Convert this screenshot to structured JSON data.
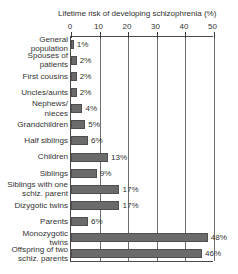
{
  "chart_data": {
    "type": "bar",
    "orientation": "horizontal",
    "title": "Lifetime risk of  developing schizophrenia (%)",
    "xlabel": "",
    "ylabel": "",
    "xlim": [
      0,
      50
    ],
    "xticks": [
      0,
      10,
      20,
      30,
      40,
      50
    ],
    "xtick_labels": [
      "0",
      "10",
      "20",
      "30",
      "40",
      "50"
    ],
    "grid": true,
    "legend": false,
    "value_label_suffix": "%",
    "categories": [
      "General population",
      "Spouses of patients",
      "First cousins",
      "Uncles/aunts",
      "Nephews/ nieces",
      "Grandchildren",
      "Half siblings",
      "Children",
      "Siblings",
      "Siblings with one schiz. parent",
      "Dizygotic twins",
      "Parents",
      "Monozygotic twins",
      "Offspring of two schiz. parents"
    ],
    "values": [
      1,
      2,
      2,
      2,
      4,
      5,
      6,
      13,
      9,
      17,
      17,
      6,
      48,
      46
    ],
    "value_labels": [
      "1%",
      "2%",
      "2%",
      "2%",
      "4%",
      "5%",
      "6%",
      "13%",
      "9%",
      "17%",
      "17%",
      "6%",
      "48%",
      "46%"
    ],
    "bars": [
      {
        "label_line1": "General",
        "label_line2": "population",
        "value": 1,
        "value_label": "1%"
      },
      {
        "label_line1": "Spouses of",
        "label_line2": "patients",
        "value": 2,
        "value_label": "2%"
      },
      {
        "label_line1": "First cousins",
        "label_line2": "",
        "value": 2,
        "value_label": "2%"
      },
      {
        "label_line1": "Uncles/aunts",
        "label_line2": "",
        "value": 2,
        "value_label": "2%"
      },
      {
        "label_line1": "Nephews/",
        "label_line2": "nieces",
        "value": 4,
        "value_label": "4%"
      },
      {
        "label_line1": "Grandchildren",
        "label_line2": "",
        "value": 5,
        "value_label": "5%"
      },
      {
        "label_line1": "Half siblings",
        "label_line2": "",
        "value": 6,
        "value_label": "6%"
      },
      {
        "label_line1": "Children",
        "label_line2": "",
        "value": 13,
        "value_label": "13%"
      },
      {
        "label_line1": "Siblings",
        "label_line2": "",
        "value": 9,
        "value_label": "9%"
      },
      {
        "label_line1": "Siblings with one",
        "label_line2": "schiz. parent",
        "value": 17,
        "value_label": "17%"
      },
      {
        "label_line1": "Dizygotic twins",
        "label_line2": "",
        "value": 17,
        "value_label": "17%"
      },
      {
        "label_line1": "Parents",
        "label_line2": "",
        "value": 6,
        "value_label": "6%"
      },
      {
        "label_line1": "Monozygotic",
        "label_line2": "twins",
        "value": 48,
        "value_label": "48%"
      },
      {
        "label_line1": "Offspring of two",
        "label_line2": "schiz. parents",
        "value": 46,
        "value_label": "46%"
      }
    ]
  },
  "colors": {
    "bar_fill": "#6b6b6b",
    "bar_stroke": "#4f4f4f",
    "axis": "#4a4a4a",
    "gridline": "#6e6e6e",
    "text": "#333333",
    "background": "#ffffff"
  }
}
